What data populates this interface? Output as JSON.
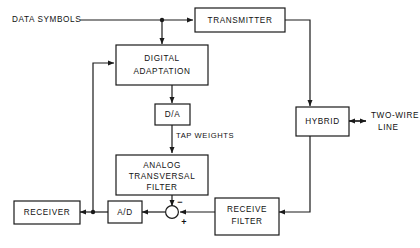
{
  "diagram": {
    "type": "block-diagram",
    "blocks": [
      {
        "id": "transmitter",
        "label": "TRANSMITTER",
        "lines": [
          "TRANSMITTER"
        ]
      },
      {
        "id": "digital-adaptation",
        "label": "DIGITAL ADAPTATION",
        "lines": [
          "DIGITAL",
          "ADAPTATION"
        ]
      },
      {
        "id": "da",
        "label": "D/A",
        "lines": [
          "D/A"
        ]
      },
      {
        "id": "analog-transversal-filter",
        "label": "ANALOG TRANSVERSAL FILTER",
        "lines": [
          "ANALOG",
          "TRANSVERSAL",
          "FILTER"
        ]
      },
      {
        "id": "hybrid",
        "label": "HYBRID",
        "lines": [
          "HYBRID"
        ]
      },
      {
        "id": "receive-filter",
        "label": "RECEIVE FILTER",
        "lines": [
          "RECEIVE",
          "FILTER"
        ]
      },
      {
        "id": "ad",
        "label": "A/D",
        "lines": [
          "A/D"
        ]
      },
      {
        "id": "receiver",
        "label": "RECEIVER",
        "lines": [
          "RECEIVER"
        ]
      }
    ],
    "free_labels": [
      {
        "id": "data-symbols",
        "label": "DATA SYMBOLS"
      },
      {
        "id": "tap-weights",
        "label": "TAP WEIGHTS"
      },
      {
        "id": "two-wire-line",
        "lines": [
          "TWO-WIRE",
          "LINE"
        ]
      }
    ],
    "summing_junction": {
      "id": "summing-junction",
      "minus_sign": "−",
      "plus_sign": "+"
    }
  }
}
